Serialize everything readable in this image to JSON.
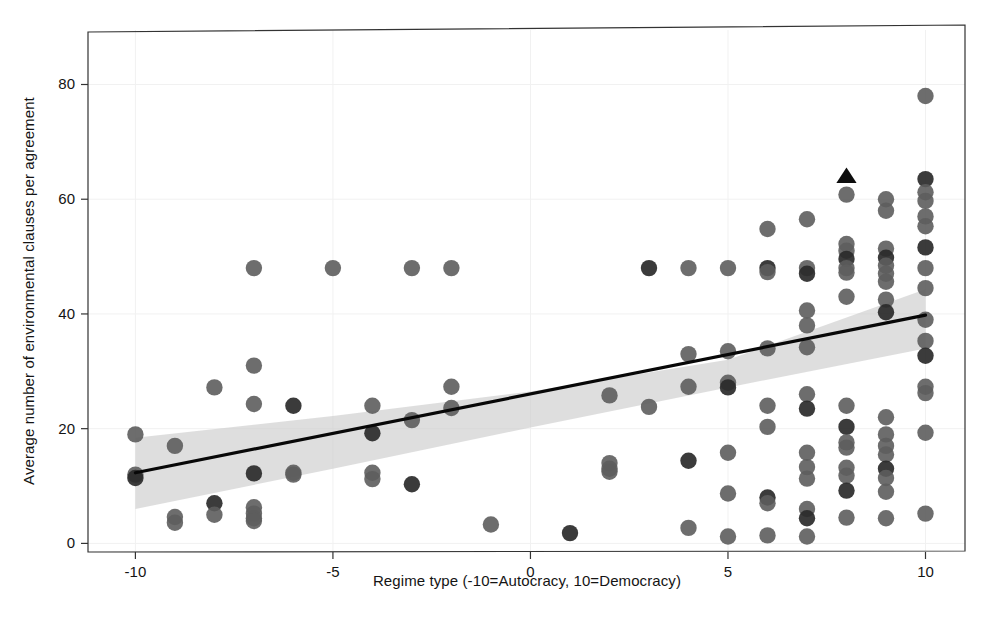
{
  "figure": {
    "background_color": "#ffffff",
    "point_color": "#5d5d5d",
    "point_dark_color": "#2a2a2a",
    "line_color": "#080808",
    "band_color": "#c9c9c9",
    "frame_color": "#333333"
  },
  "chart_data": {
    "type": "scatter",
    "title": "",
    "xlabel": "Regime type (-10=Autocracy, 10=Democracy)",
    "ylabel": "Average number of environmental clauses per agreement",
    "xlim": [
      -11.2,
      11.0
    ],
    "ylim": [
      -1.5,
      89.5
    ],
    "xticks": [
      -10,
      -5,
      0,
      5,
      10
    ],
    "xticklabels": [
      "-10",
      "-5",
      "0",
      "5",
      "10"
    ],
    "yticks": [
      0,
      20,
      40,
      60,
      80
    ],
    "yticklabels": [
      "0",
      "20",
      "40",
      "60",
      "80"
    ],
    "grid": "faint",
    "legend": "none",
    "series": [
      {
        "name": "observations",
        "marker": "circle",
        "color": "#5d5d5d",
        "points": [
          [
            -10,
            19.0
          ],
          [
            -10,
            12.0
          ],
          [
            -10,
            11.4
          ],
          [
            -9,
            17.0
          ],
          [
            -9,
            4.6
          ],
          [
            -9,
            3.6
          ],
          [
            -8,
            27.2
          ],
          [
            -8,
            7.0
          ],
          [
            -8,
            5.0
          ],
          [
            -7,
            48.0
          ],
          [
            -7,
            31.0
          ],
          [
            -7,
            24.3
          ],
          [
            -7,
            12.2
          ],
          [
            -7,
            6.3
          ],
          [
            -7,
            5.2
          ],
          [
            -7,
            4.4
          ],
          [
            -7,
            3.9
          ],
          [
            -6,
            24.0
          ],
          [
            -6,
            12.3
          ],
          [
            -6,
            12.0
          ],
          [
            -5,
            48.0
          ],
          [
            -4,
            24.0
          ],
          [
            -4,
            19.2
          ],
          [
            -4,
            12.3
          ],
          [
            -4,
            11.2
          ],
          [
            -3,
            48.0
          ],
          [
            -3,
            21.5
          ],
          [
            -3,
            10.3
          ],
          [
            -2,
            48.0
          ],
          [
            -2,
            27.3
          ],
          [
            -2,
            23.6
          ],
          [
            -1,
            3.3
          ],
          [
            1,
            1.8
          ],
          [
            2,
            25.8
          ],
          [
            2,
            14.0
          ],
          [
            2,
            13.0
          ],
          [
            2,
            12.5
          ],
          [
            3,
            48.0
          ],
          [
            3,
            23.8
          ],
          [
            4,
            48.0
          ],
          [
            4,
            33.0
          ],
          [
            4,
            27.3
          ],
          [
            4,
            14.4
          ],
          [
            4,
            2.7
          ],
          [
            5,
            48.0
          ],
          [
            5,
            33.5
          ],
          [
            5,
            28.0
          ],
          [
            5,
            27.2
          ],
          [
            5,
            15.8
          ],
          [
            5,
            8.7
          ],
          [
            5,
            1.2
          ],
          [
            6,
            54.8
          ],
          [
            6,
            48.0
          ],
          [
            6,
            47.3
          ],
          [
            6,
            34.0
          ],
          [
            6,
            24.0
          ],
          [
            6,
            20.3
          ],
          [
            6,
            8.0
          ],
          [
            6,
            7.0
          ],
          [
            6,
            1.4
          ],
          [
            7,
            56.5
          ],
          [
            7,
            48.0
          ],
          [
            7,
            47.0
          ],
          [
            7,
            40.6
          ],
          [
            7,
            38.0
          ],
          [
            7,
            34.2
          ],
          [
            7,
            26.0
          ],
          [
            7,
            23.5
          ],
          [
            7,
            15.8
          ],
          [
            7,
            13.3
          ],
          [
            7,
            11.3
          ],
          [
            7,
            6.0
          ],
          [
            7,
            4.4
          ],
          [
            7,
            1.2
          ],
          [
            8,
            60.8
          ],
          [
            8,
            52.2
          ],
          [
            8,
            51.0
          ],
          [
            8,
            49.6
          ],
          [
            8,
            48.0
          ],
          [
            8,
            47.2
          ],
          [
            8,
            43.0
          ],
          [
            8,
            24.0
          ],
          [
            8,
            20.3
          ],
          [
            8,
            17.6
          ],
          [
            8,
            16.7
          ],
          [
            8,
            13.2
          ],
          [
            8,
            11.8
          ],
          [
            8,
            9.2
          ],
          [
            8,
            4.5
          ],
          [
            9,
            60.0
          ],
          [
            9,
            58.0
          ],
          [
            9,
            51.4
          ],
          [
            9,
            49.8
          ],
          [
            9,
            48.4
          ],
          [
            9,
            47.0
          ],
          [
            9,
            45.6
          ],
          [
            9,
            42.5
          ],
          [
            9,
            40.3
          ],
          [
            9,
            22.0
          ],
          [
            9,
            19.0
          ],
          [
            9,
            17.0
          ],
          [
            9,
            15.5
          ],
          [
            9,
            13.0
          ],
          [
            9,
            11.4
          ],
          [
            9,
            9.0
          ],
          [
            9,
            4.4
          ],
          [
            10,
            78.0
          ],
          [
            10,
            63.5
          ],
          [
            10,
            61.2
          ],
          [
            10,
            59.7
          ],
          [
            10,
            57.0
          ],
          [
            10,
            55.3
          ],
          [
            10,
            51.6
          ],
          [
            10,
            48.0
          ],
          [
            10,
            44.5
          ],
          [
            10,
            39.0
          ],
          [
            10,
            35.3
          ],
          [
            10,
            32.7
          ],
          [
            10,
            27.3
          ],
          [
            10,
            26.2
          ],
          [
            10,
            19.3
          ],
          [
            10,
            5.2
          ]
        ]
      },
      {
        "name": "highlighted-case",
        "marker": "triangle",
        "color": "#0d0d0d",
        "points": [
          [
            8,
            64.0
          ]
        ]
      }
    ],
    "fit": {
      "name": "linear-fit",
      "x": [
        -10,
        10
      ],
      "y": [
        12.3,
        39.8
      ],
      "ci_band": {
        "x": [
          -10,
          -5,
          0,
          5,
          10
        ],
        "lower": [
          6.0,
          13.0,
          20.2,
          27.2,
          34.0
        ],
        "upper": [
          18.4,
          22.2,
          26.5,
          32.0,
          44.3
        ]
      }
    }
  }
}
